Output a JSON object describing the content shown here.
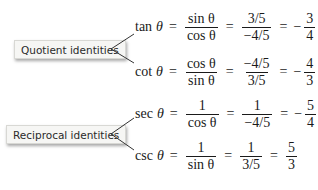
{
  "labels": {
    "quotient": "Quotient identities",
    "reciprocal": "Reciprocal identities"
  },
  "theta": "θ",
  "equations": [
    {
      "fn": "tan",
      "f1_num": "sin θ",
      "f1_den": "cos θ",
      "f2_num": "3/5",
      "f2_den": "−4/5",
      "sign": "−",
      "f3_num": "3",
      "f3_den": "4",
      "eq": "="
    },
    {
      "fn": "cot",
      "f1_num": "cos θ",
      "f1_den": "sin θ",
      "f2_num": "−4/5",
      "f2_den": "3/5",
      "sign": "−",
      "f3_num": "4",
      "f3_den": "3",
      "eq": "="
    },
    {
      "fn": "sec",
      "f1_num": "1",
      "f1_den": "cos θ",
      "f2_num": "1",
      "f2_den": "−4/5",
      "sign": "−",
      "f3_num": "5",
      "f3_den": "4",
      "eq": "="
    },
    {
      "fn": "csc",
      "f1_num": "1",
      "f1_den": "sin θ",
      "f2_num": "1",
      "f2_den": "3/5",
      "sign": "",
      "f3_num": "5",
      "f3_den": "3",
      "eq": "="
    }
  ]
}
